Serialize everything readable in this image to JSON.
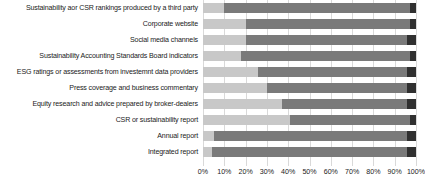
{
  "chart_data": {
    "type": "bar",
    "title": "",
    "xlabel": "",
    "ylabel": "",
    "orientation": "horizontal",
    "stacked": true,
    "grid": true,
    "legend": "none",
    "xlim": [
      0,
      100
    ],
    "xticks": [
      "0%",
      "10%",
      "20%",
      "30%",
      "40%",
      "50%",
      "60%",
      "70%",
      "80%",
      "90%",
      "100%"
    ],
    "xtick_values": [
      0,
      10,
      20,
      30,
      40,
      50,
      60,
      70,
      80,
      90,
      100
    ],
    "categories": [
      "Sustainability aor CSR rankings produced by a third party",
      "Corporate website",
      "Social media channels",
      "Sustainability Accounting Standards Board indicators",
      "ESG ratings or assessments from investemnt data providers",
      "Press coverage and business commentary",
      "Equity research and advice prepared by broker-dealers",
      "CSR or sustainability report",
      "Annual report",
      "Integrated report"
    ],
    "series": [
      {
        "name": "segment-1",
        "color": "#c8c8c8",
        "values": [
          10,
          20,
          20,
          18,
          26,
          30,
          37,
          41,
          5,
          4
        ]
      },
      {
        "name": "segment-2",
        "color": "#7a7a7a",
        "values": [
          87,
          77,
          76,
          79,
          70,
          66,
          59,
          56,
          91,
          92
        ]
      },
      {
        "name": "segment-3",
        "color": "#303030",
        "values": [
          3,
          3,
          4,
          3,
          4,
          4,
          4,
          3,
          4,
          4
        ]
      }
    ]
  }
}
